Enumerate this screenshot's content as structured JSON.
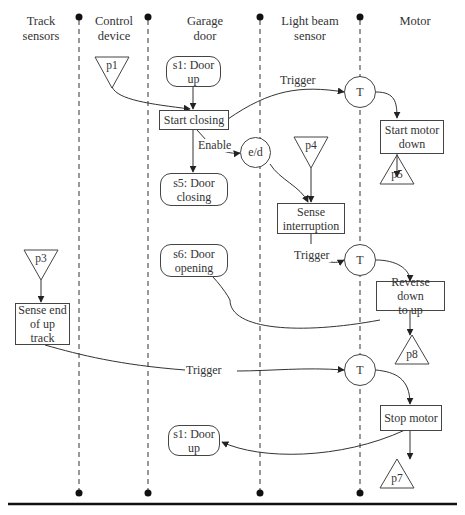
{
  "lanes": [
    {
      "label_line1": "Track",
      "label_line2": "sensors"
    },
    {
      "label_line1": "Control",
      "label_line2": "device"
    },
    {
      "label_line1": "Garage",
      "label_line2": "door"
    },
    {
      "label_line1": "Light beam",
      "label_line2": "sensor"
    },
    {
      "label_line1": "Motor",
      "label_line2": ""
    }
  ],
  "places": {
    "p1": "p1",
    "p3": "p3",
    "p4": "p4",
    "p5": "p5",
    "p7": "p7",
    "p8": "p8"
  },
  "states": {
    "s1_top": {
      "line1": "s1: Door",
      "line2": "up"
    },
    "s5": {
      "line1": "s5: Door",
      "line2": "closing"
    },
    "s6": {
      "line1": "s6: Door",
      "line2": "opening"
    },
    "s1_bottom": {
      "line1": "s1: Door",
      "line2": "up"
    }
  },
  "actions": {
    "start_closing": "Start closing",
    "start_motor_down": {
      "line1": "Start motor",
      "line2": "down"
    },
    "sense_interruption": {
      "line1": "Sense",
      "line2": "interruption"
    },
    "reverse": {
      "line1": "Reverse down",
      "line2": "to up"
    },
    "sense_end": {
      "line1": "Sense end",
      "line2": "of up",
      "line3": "track"
    },
    "stop_motor": "Stop motor"
  },
  "nodes": {
    "t1": "T",
    "t2": "T",
    "t3": "T",
    "ed": "e/d"
  },
  "edge_labels": {
    "trigger1": "Trigger",
    "enable": "Enable",
    "trigger2": "Trigger",
    "trigger3": "Trigger"
  }
}
